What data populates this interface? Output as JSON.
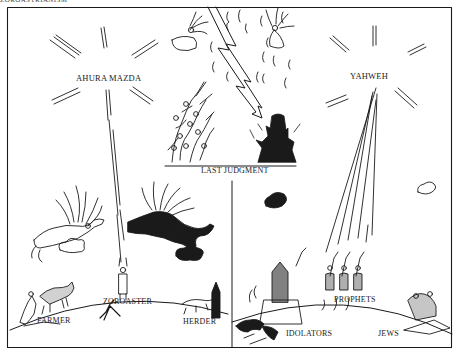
{
  "figure": {
    "header_fragment": "ZOROASTRIANISM",
    "colors": {
      "ink": "#1a1a1a",
      "paper": "#ffffff"
    },
    "labels": {
      "ahura_mazda": "AHURA  MAZDA",
      "yahweh": "YAHWEH",
      "last_judgment": "LAST JUDGMENT",
      "zoroaster": "ZOROASTER",
      "farmer": "FARMER",
      "herder": "HERDER",
      "idolators": "IDOLATORS",
      "prophets": "PROPHETS",
      "jews": "JEWS"
    },
    "panels": [
      {
        "name": "Zoroastrian world",
        "side": "left",
        "deity": "AHURA MAZDA",
        "figures": [
          "FARMER",
          "ZOROASTER",
          "HERDER"
        ]
      },
      {
        "name": "Hebrew world",
        "side": "right",
        "deity": "YAHWEH",
        "figures": [
          "IDOLATORS",
          "PROPHETS",
          "JEWS"
        ]
      },
      {
        "name": "Shared top scene",
        "side": "center",
        "caption": "LAST JUDGMENT"
      }
    ]
  }
}
